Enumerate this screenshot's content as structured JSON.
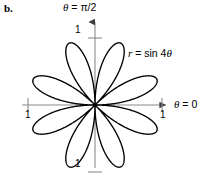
{
  "figure": {
    "panel_label": "b.",
    "background_color": "#ffffff",
    "curve_color": "#000000",
    "axis_color": "#7a7a7a"
  },
  "labels": {
    "vertical_axis": {
      "theta": "θ",
      "equals": " = ",
      "value": "π/2"
    },
    "horizontal_axis": {
      "theta": "θ",
      "equals": " = ",
      "value": "0"
    },
    "equation": {
      "r": "r",
      "equals": " = ",
      "expression": "sin 4",
      "theta": "θ"
    }
  },
  "ticks": {
    "top": "1",
    "left": "1",
    "right": "1",
    "bottom": "1"
  },
  "chart_data": {
    "type": "line",
    "subtype": "polar-rose",
    "title": "",
    "equation": "r = sin 4θ",
    "polar": true,
    "petal_count": 8,
    "k": 4,
    "amplitude": 1,
    "theta_range_deg": [
      0,
      360
    ],
    "r_range": [
      0,
      1
    ],
    "rlim": [
      0,
      1
    ],
    "rticks": [
      1
    ],
    "grid": false,
    "legend": false,
    "axis_labels": {
      "theta_vertical": "θ = π/2",
      "theta_horizontal": "θ = 0"
    },
    "petal_tip_angles_deg": [
      22.5,
      67.5,
      112.5,
      157.5,
      202.5,
      247.5,
      292.5,
      337.5
    ],
    "petal_tip_radius": 1,
    "series": [
      {
        "name": "r = sin 4θ",
        "color": "#000000",
        "points_theta_deg": [
          0,
          11.25,
          22.5,
          33.75,
          45,
          56.25,
          67.5,
          78.75,
          90,
          101.25,
          112.5,
          123.75,
          135,
          146.25,
          157.5,
          168.75,
          180,
          191.25,
          202.5,
          213.75,
          225,
          236.25,
          247.5,
          258.75,
          270,
          281.25,
          292.5,
          303.75,
          315,
          326.25,
          337.5,
          348.75,
          360
        ],
        "points_r": [
          0,
          0.707,
          1,
          0.707,
          0,
          -0.707,
          -1,
          -0.707,
          0,
          0.707,
          1,
          0.707,
          0,
          -0.707,
          -1,
          -0.707,
          0,
          0.707,
          1,
          0.707,
          0,
          -0.707,
          -1,
          -0.707,
          0,
          0.707,
          1,
          0.707,
          0,
          -0.707,
          -1,
          -0.707,
          0
        ]
      }
    ]
  }
}
